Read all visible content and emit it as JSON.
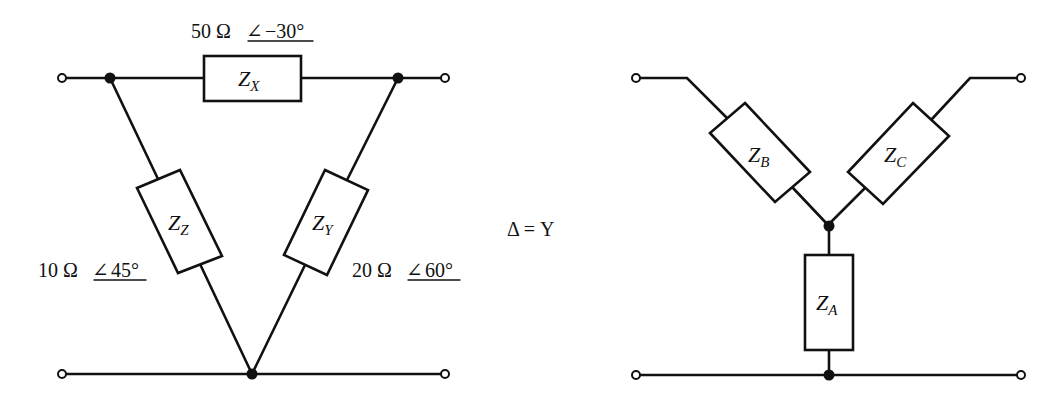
{
  "equation": "Δ = Y",
  "colors": {
    "line": "#111111",
    "background": "#ffffff"
  },
  "delta": {
    "impedances": {
      "ZX": {
        "symbol": "Z",
        "subscript": "X",
        "magnitude": "50 Ω",
        "angle_symbol": "∠",
        "angle": "−30°"
      },
      "ZY": {
        "symbol": "Z",
        "subscript": "Y",
        "magnitude": "20 Ω",
        "angle_symbol": "∠",
        "angle": "60°"
      },
      "ZZ": {
        "symbol": "Z",
        "subscript": "Z",
        "magnitude": "10 Ω",
        "angle_symbol": "∠",
        "angle": "45°"
      }
    },
    "terminals": 4,
    "nodes": 3
  },
  "wye": {
    "impedances": {
      "ZA": {
        "symbol": "Z",
        "subscript": "A"
      },
      "ZB": {
        "symbol": "Z",
        "subscript": "B"
      },
      "ZC": {
        "symbol": "Z",
        "subscript": "C"
      }
    },
    "terminals": 4,
    "nodes": 2
  }
}
